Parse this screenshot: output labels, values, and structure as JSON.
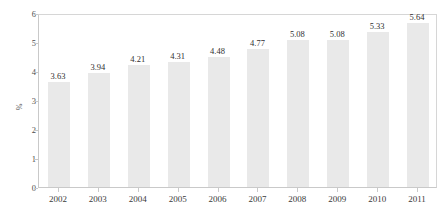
{
  "chart_data": {
    "type": "bar",
    "title": "",
    "xlabel": "",
    "ylabel": "%",
    "categories": [
      "2002",
      "2003",
      "2004",
      "2005",
      "2006",
      "2007",
      "2008",
      "2009",
      "2010",
      "2011"
    ],
    "values": [
      3.63,
      3.94,
      4.21,
      4.31,
      4.48,
      4.77,
      5.08,
      5.08,
      5.33,
      5.64
    ],
    "data_labels": [
      "3.63",
      "3.94",
      "4.21",
      "4.31",
      "4.48",
      "4.77",
      "5.08",
      "5.08",
      "5.33",
      "5.64"
    ],
    "ylim": [
      0,
      6
    ],
    "yticks": [
      "0",
      "1",
      "2",
      "3",
      "4",
      "5",
      "6"
    ],
    "grid": false,
    "legend": "none",
    "series_color": "#e9e9e9",
    "axis_color": "#c9c9c9",
    "text_color": "#3b3b3b"
  }
}
